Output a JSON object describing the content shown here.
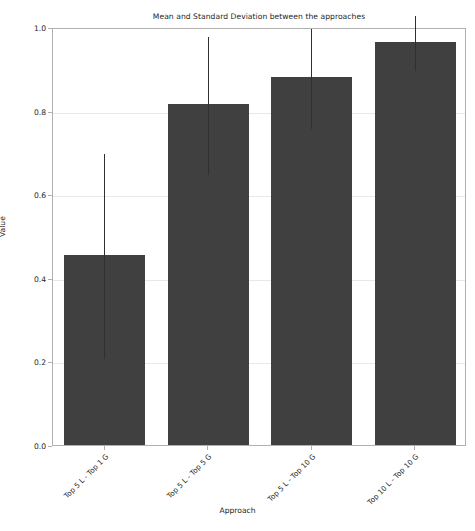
{
  "chart_data": {
    "type": "bar",
    "title": "Mean and Standard Deviation between the approaches",
    "xlabel": "Approach",
    "ylabel": "Value",
    "categories": [
      "Top 5 L - Top 1 G",
      "Top 5 L - Top 5 G",
      "Top 5 L - Top 10 G",
      "Top 10 L - Top 10 G"
    ],
    "values": [
      0.455,
      0.815,
      0.88,
      0.965
    ],
    "errors": [
      0.245,
      0.165,
      0.12,
      0.065
    ],
    "ylim": [
      0.0,
      1.0
    ],
    "yticks": [
      0.0,
      0.2,
      0.4,
      0.6,
      0.8,
      1.0
    ],
    "ytick_labels": [
      "0.0",
      "0.2",
      "0.4",
      "0.6",
      "0.8",
      "1.0"
    ],
    "grid": true,
    "legend": null,
    "bar_color": "#404040",
    "errorbar_color": "#303030",
    "grid_color": "#e8e8e8"
  }
}
